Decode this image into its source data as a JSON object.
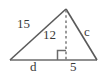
{
  "figure": {
    "kind": "geometry-diagram",
    "shape": "triangle-with-altitude",
    "background_color": "#ffffff",
    "stroke_color": "#5a5a5a",
    "text_color": "#3a3a3a",
    "labels": {
      "left_side": "15",
      "altitude": "12",
      "right_side": "c",
      "left_base_segment": "d",
      "right_base_segment": "5"
    },
    "markers": {
      "right_angle": "right-angle-square"
    },
    "geometry": {
      "apex": [
        66,
        9
      ],
      "left_vertex": [
        10,
        60
      ],
      "right_vertex": [
        97,
        60
      ],
      "foot_of_altitude": [
        66,
        60
      ],
      "altitude_style": "dashed"
    }
  }
}
